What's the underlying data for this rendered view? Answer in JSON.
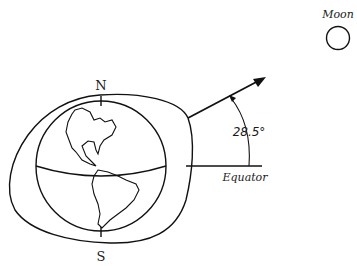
{
  "diagram": {
    "moon_label": "Moon",
    "north_label": "N",
    "south_label": "S",
    "equator_label": "Equator",
    "angle_label": "28.5°",
    "angle_value_deg": 28.5,
    "colors": {
      "ink": "#111111",
      "background": "#ffffff"
    }
  }
}
